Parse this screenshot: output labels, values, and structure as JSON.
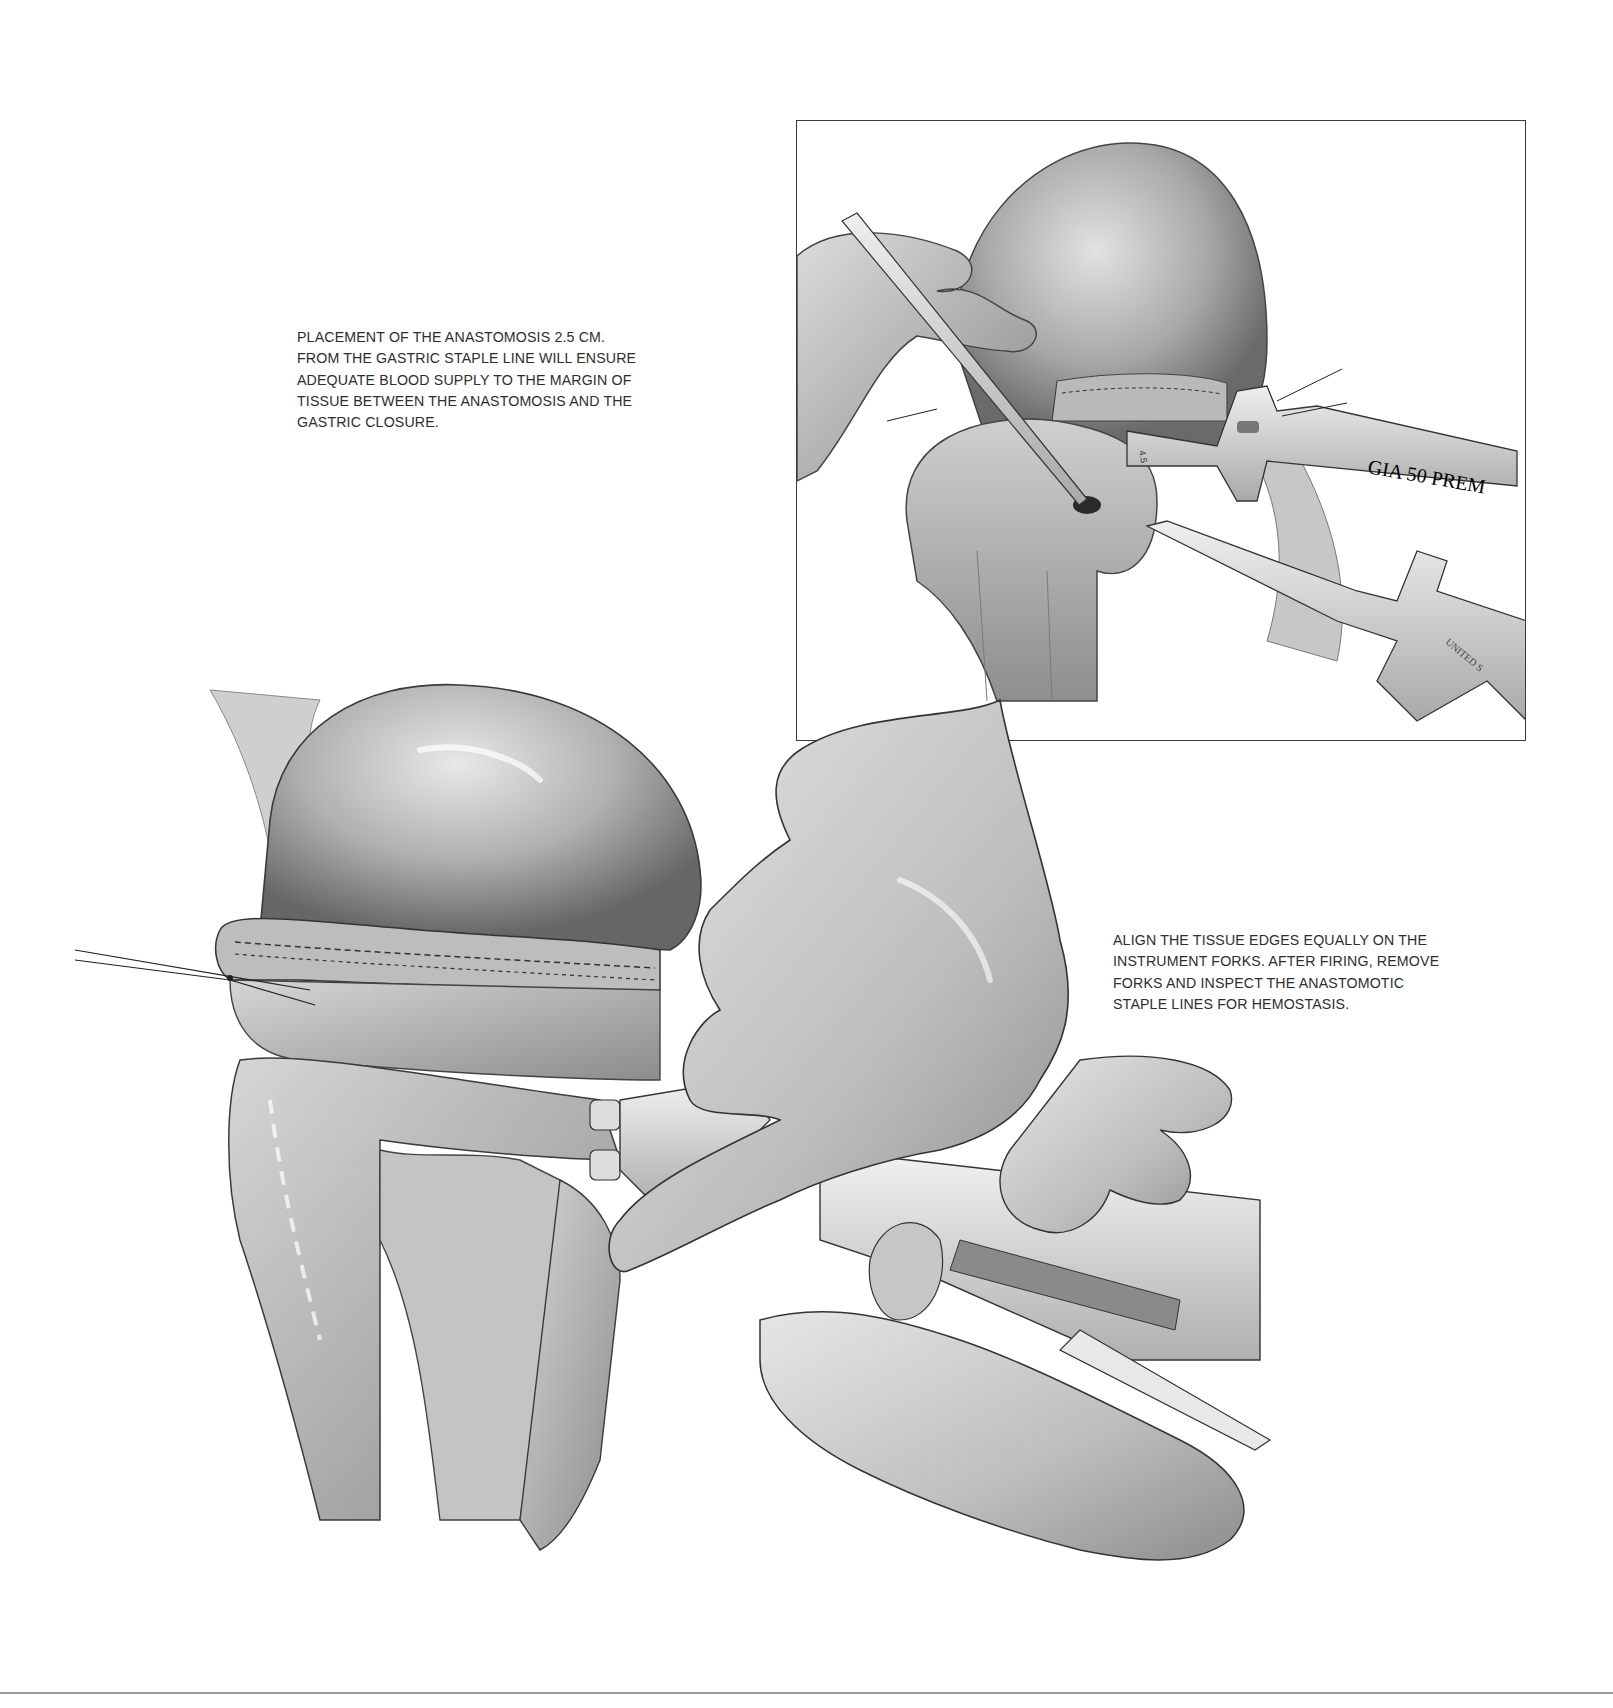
{
  "document": {
    "type": "surgical-illustration-plate",
    "background_color": "#ffffff",
    "ink_color": "#2e2e2e"
  },
  "captions": {
    "top": "PLACEMENT OF THE ANASTOMOSIS 2.5 CM.\nFROM THE GASTRIC STAPLE LINE WILL ENSURE\nADEQUATE BLOOD SUPPLY TO THE MARGIN OF\nTISSUE BETWEEN THE ANASTOMOSIS AND THE\nGASTRIC CLOSURE.",
    "bottom": "ALIGN THE TISSUE EDGES EQUALLY ON THE\nINSTRUMENT FORKS. AFTER FIRING, REMOVE\nFORKS AND INSPECT THE ANASTOMOTIC\nSTAPLE LINES FOR HEMOSTASIS."
  },
  "inset": {
    "description": "Inset view: forceps and stapler forks inserted into enterotomy beside gastric staple line",
    "instrument_label": "GIA 50 PREM",
    "instrument_label_2": "UNITED S",
    "instrument_marking": "4.5"
  },
  "main_illustration": {
    "description": "Hands holding GIA stapler with forks inserted into stomach and jejunal loop for side-to-side anastomosis"
  },
  "signature": "WBaker"
}
